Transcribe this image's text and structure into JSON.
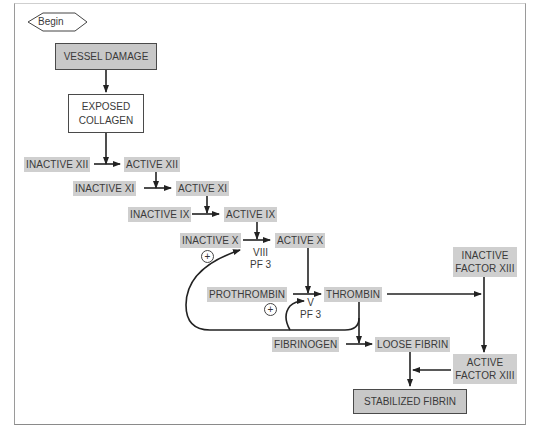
{
  "diagram": {
    "type": "flowchart",
    "start": {
      "label": "Begin"
    },
    "nodes": {
      "vessel_damage": "VESSEL DAMAGE",
      "exposed_collagen": "EXPOSED\nCOLLAGEN",
      "inactive_xii": "INACTIVE XII",
      "active_xii": "ACTIVE XII",
      "inactive_xi": "INACTIVE XI",
      "active_xi": "ACTIVE XI",
      "inactive_ix": "INACTIVE IX",
      "active_ix": "ACTIVE IX",
      "inactive_x": "INACTIVE X",
      "active_x": "ACTIVE X",
      "cofactor_x": "VIII\nPF 3",
      "prothrombin": "PROTHROMBIN",
      "thrombin": "THROMBIN",
      "cofactor_thrombin": "V\nPF 3",
      "fibrinogen": "FIBRINOGEN",
      "loose_fibrin": "LOOSE FIBRIN",
      "inactive_factor_xiii": "INACTIVE\nFACTOR XIII",
      "active_factor_xiii": "ACTIVE\nFACTOR XIII",
      "stabilized_fibrin": "STABILIZED FIBRIN"
    },
    "feedback_symbols": {
      "plus": "+"
    },
    "edges": [
      [
        "Begin",
        "VESSEL DAMAGE"
      ],
      [
        "VESSEL DAMAGE",
        "EXPOSED COLLAGEN"
      ],
      [
        "EXPOSED COLLAGEN",
        "INACTIVE XII -> ACTIVE XII"
      ],
      [
        "ACTIVE XII",
        "INACTIVE XI -> ACTIVE XI"
      ],
      [
        "ACTIVE XI",
        "INACTIVE IX -> ACTIVE IX"
      ],
      [
        "ACTIVE IX",
        "INACTIVE X -> ACTIVE X"
      ],
      [
        "ACTIVE X",
        "PROTHROMBIN -> THROMBIN"
      ],
      [
        "THROMBIN",
        "FIBRINOGEN -> LOOSE FIBRIN"
      ],
      [
        "THROMBIN",
        "INACTIVE FACTOR XIII"
      ],
      [
        "INACTIVE FACTOR XIII",
        "ACTIVE FACTOR XIII"
      ],
      [
        "ACTIVE FACTOR XIII",
        "LOOSE FIBRIN -> STABILIZED FIBRIN"
      ],
      [
        "LOOSE FIBRIN",
        "STABILIZED FIBRIN"
      ],
      [
        "THROMBIN",
        "VIII PF 3 (+ feedback)"
      ],
      [
        "THROMBIN",
        "V PF 3 (+ feedback)"
      ]
    ]
  }
}
